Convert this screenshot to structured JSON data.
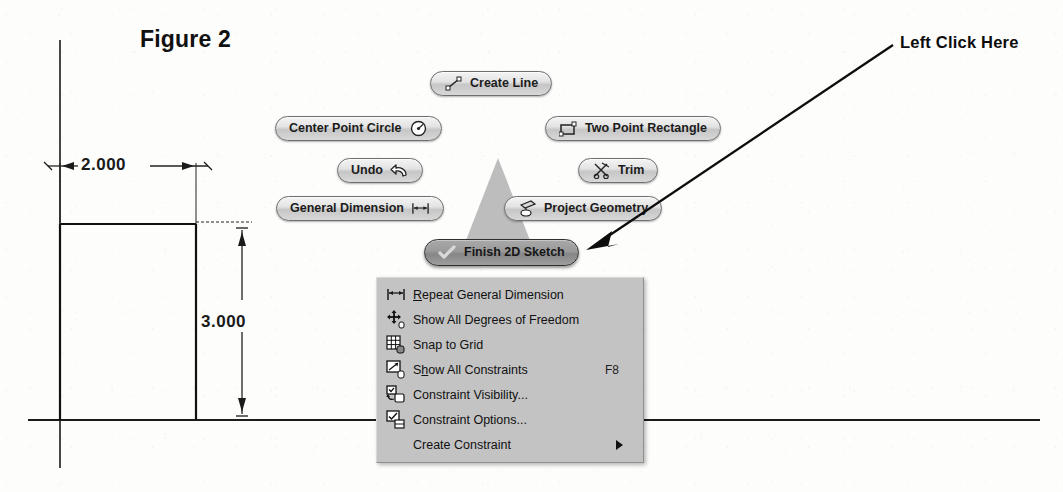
{
  "figure": {
    "title": "Figure 2"
  },
  "sketch": {
    "dimensions": [
      {
        "name": "horizontal",
        "value": "2.000"
      },
      {
        "name": "vertical",
        "value": "3.000"
      }
    ]
  },
  "marking_menu": {
    "items": [
      {
        "label": "Create Line",
        "icon": "line-icon",
        "icon_side": "left",
        "highlighted": false
      },
      {
        "label": "Center Point Circle",
        "icon": "circle-icon",
        "icon_side": "right",
        "highlighted": false
      },
      {
        "label": "Two Point Rectangle",
        "icon": "rectangle-icon",
        "icon_side": "left",
        "highlighted": false
      },
      {
        "label": "Undo",
        "icon": "undo-arrow-icon",
        "icon_side": "right",
        "highlighted": false
      },
      {
        "label": "Trim",
        "icon": "scissors-icon",
        "icon_side": "left",
        "highlighted": false
      },
      {
        "label": "General Dimension",
        "icon": "dimension-icon",
        "icon_side": "right",
        "highlighted": false
      },
      {
        "label": "Project Geometry",
        "icon": "project-geometry-icon",
        "icon_side": "left",
        "highlighted": false
      },
      {
        "label": "Finish 2D Sketch",
        "icon": "checkmark-icon",
        "icon_side": "left",
        "highlighted": true
      }
    ]
  },
  "context_menu": {
    "items": [
      {
        "label_before": "",
        "label_underlined": "R",
        "label_after": "epeat General Dimension",
        "icon": "dimension-icon",
        "shortcut": "",
        "submenu": false
      },
      {
        "label_before": "Show All Degrees of Freedom",
        "label_underlined": "",
        "label_after": "",
        "icon": "degrees-of-freedom-icon",
        "shortcut": "",
        "submenu": false
      },
      {
        "label_before": "Snap to Grid",
        "label_underlined": "",
        "label_after": "",
        "icon": "snap-to-grid-icon",
        "shortcut": "",
        "submenu": false
      },
      {
        "label_before": "S",
        "label_underlined": "h",
        "label_after": "ow All Constraints",
        "icon": "show-constraints-icon",
        "shortcut": "F8",
        "submenu": false
      },
      {
        "label_before": "Constraint Visibility...",
        "label_underlined": "",
        "label_after": "",
        "icon": "constraint-visibility-icon",
        "shortcut": "",
        "submenu": false
      },
      {
        "label_before": "Constraint Options...",
        "label_underlined": "",
        "label_after": "",
        "icon": "constraint-options-icon",
        "shortcut": "",
        "submenu": false
      },
      {
        "label_before": "Create Constraint",
        "label_underlined": "",
        "label_after": "",
        "icon": "",
        "shortcut": "",
        "submenu": true
      }
    ]
  },
  "annotation": {
    "label": "Left Click Here"
  },
  "colors": {
    "button_border": "#6e6e6e",
    "button_face": "#e3e3e3",
    "button_highlighted": "#9a9a9a",
    "menu_background": "#c3c3c3",
    "ink": "#111111",
    "page": "#fdfdfc"
  }
}
